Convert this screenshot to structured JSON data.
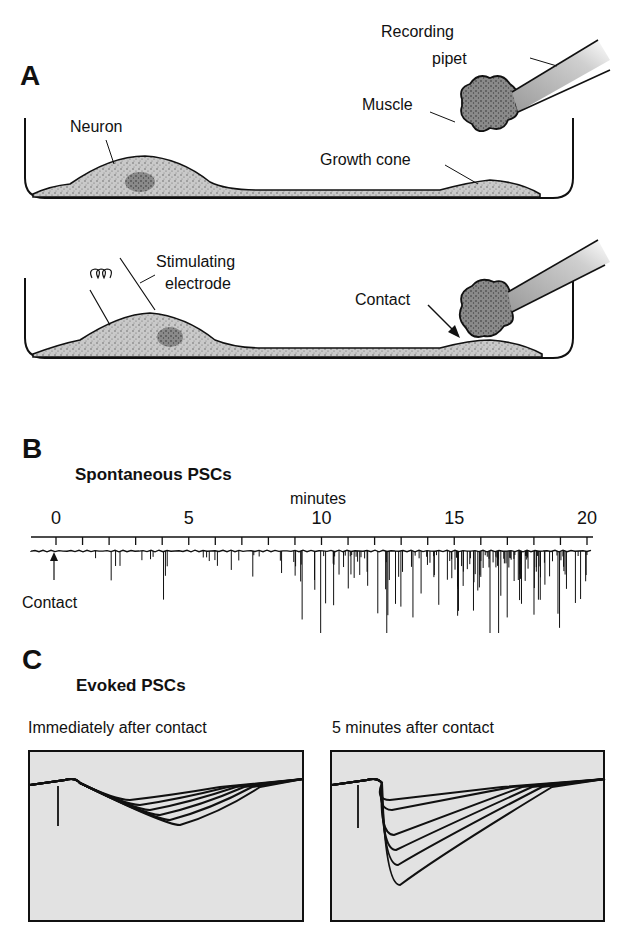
{
  "panel_a": {
    "letter": "A",
    "labels": {
      "recording_pipet_line1": "Recording",
      "recording_pipet_line2": "pipet",
      "muscle": "Muscle",
      "neuron": "Neuron",
      "growth_cone": "Growth cone",
      "stimulating_line1": "Stimulating",
      "stimulating_line2": "electrode",
      "contact": "Contact"
    }
  },
  "panel_b": {
    "letter": "B",
    "title": "Spontaneous PSCs",
    "axis_label": "minutes",
    "contact_label": "Contact"
  },
  "panel_c": {
    "letter": "C",
    "title": "Evoked PSCs",
    "left_caption": "Immediately after contact",
    "right_caption": "5 minutes after contact"
  },
  "chart_data": [
    {
      "type": "line",
      "title": "Spontaneous PSCs",
      "xlabel": "minutes",
      "ylabel": "",
      "x_ticks": [
        0,
        5,
        10,
        15,
        20
      ],
      "xlim": [
        0,
        20
      ],
      "minor_tick_interval": 1,
      "annotation": "Contact at t=0",
      "description": "Continuous current trace; downward deflections (PSCs) sparse before ~9 min, increasing in frequency and amplitude after 10 min, densest 15-20 min",
      "event_density_per_minute_approx": [
        0,
        1,
        3,
        3,
        3,
        4,
        3,
        3,
        3,
        8,
        10,
        12,
        9,
        8,
        10,
        18,
        20,
        20,
        16,
        12
      ]
    },
    {
      "type": "line",
      "title": "Immediately after contact",
      "description": "Superimposed evoked PSC traces: stimulus artifact then small, slow inward currents",
      "n_traces": 6,
      "relative_peak_amplitudes": [
        0.15,
        0.2,
        0.25,
        0.3,
        0.35,
        0.4
      ]
    },
    {
      "type": "line",
      "title": "5 minutes after contact",
      "description": "Superimposed evoked PSC traces: stimulus artifact then larger, faster inward currents of graded amplitude",
      "n_traces": 6,
      "relative_peak_amplitudes": [
        0.15,
        0.25,
        0.5,
        0.65,
        0.8,
        1.0
      ]
    }
  ]
}
